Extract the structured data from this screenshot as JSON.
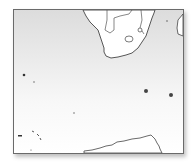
{
  "map": {
    "type": "locator-map",
    "region": "Southern Africa and South Atlantic / Southern Ocean",
    "colors": {
      "ocean_top": "#dcdcdc",
      "ocean_bottom": "#ffffff",
      "land": "#ffffff",
      "coastline": "#444444",
      "frame": "#6a6a6a"
    },
    "features": [
      {
        "name": "southern-africa-landmass"
      },
      {
        "name": "lesotho-outline"
      },
      {
        "name": "eswatini-outline"
      },
      {
        "name": "madagascar-edge"
      },
      {
        "name": "island-west-1"
      },
      {
        "name": "island-west-2"
      },
      {
        "name": "island-center"
      },
      {
        "name": "prince-edward-islands"
      },
      {
        "name": "crozet-islands"
      },
      {
        "name": "southwest-island-chain"
      },
      {
        "name": "antarctica-coast"
      }
    ]
  }
}
